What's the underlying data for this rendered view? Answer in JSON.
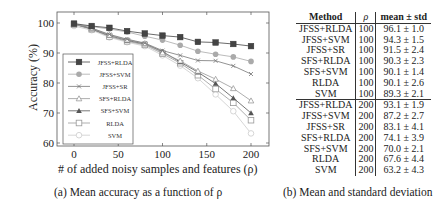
{
  "figure": {
    "caption_a": "(a) Mean accuracy as a function of ρ",
    "caption_b": "(b) Mean and standard deviation"
  },
  "chart_data": {
    "type": "line",
    "title": "",
    "xlabel": "# of added noisy samples and features (ρ)",
    "ylabel": "Accuracy (%)",
    "xlim": [
      -20,
      220
    ],
    "ylim": [
      60,
      103
    ],
    "xticks": [
      0,
      50,
      100,
      150,
      200
    ],
    "yticks": [
      60,
      70,
      80,
      90,
      100
    ],
    "grid": false,
    "legend_position": "lower left",
    "x": [
      0,
      20,
      40,
      60,
      80,
      100,
      120,
      140,
      160,
      180,
      200
    ],
    "series": [
      {
        "name": "JFSS+RLDA",
        "marker": "square-filled",
        "color": "#444444",
        "values": [
          99.8,
          99.0,
          98.4,
          97.3,
          96.5,
          95.8,
          95.3,
          93.7,
          93.5,
          93.0,
          92.3
        ]
      },
      {
        "name": "JFSS+SVM",
        "marker": "circle-filled",
        "color": "#aaaaaa",
        "values": [
          99.6,
          98.8,
          98.0,
          97.0,
          95.6,
          94.3,
          92.6,
          90.6,
          89.6,
          88.7,
          87.2
        ]
      },
      {
        "name": "JFSS+SR",
        "marker": "x",
        "color": "#777777",
        "values": [
          99.8,
          98.3,
          96.2,
          94.6,
          93.3,
          90.8,
          89.2,
          87.5,
          87.4,
          85.7,
          83.0
        ]
      },
      {
        "name": "SFS+RLDA",
        "marker": "triangle-open",
        "color": "#999999",
        "values": [
          99.6,
          98.2,
          96.0,
          94.4,
          93.2,
          90.1,
          87.4,
          84.0,
          81.3,
          78.2,
          74.1
        ]
      },
      {
        "name": "SFS+SVM",
        "marker": "triangle-filled",
        "color": "#555555",
        "values": [
          99.7,
          98.0,
          95.8,
          94.2,
          93.0,
          90.5,
          87.0,
          83.6,
          79.8,
          75.0,
          70.0
        ]
      },
      {
        "name": "RLDA",
        "marker": "square-open",
        "color": "#999999",
        "values": [
          99.5,
          97.9,
          95.5,
          93.9,
          92.7,
          89.8,
          86.6,
          82.6,
          78.0,
          73.4,
          67.6
        ]
      },
      {
        "name": "SVM",
        "marker": "circle-open",
        "color": "#cccccc",
        "values": [
          99.0,
          97.6,
          95.2,
          93.6,
          92.3,
          89.2,
          85.8,
          81.6,
          76.2,
          70.6,
          63.2
        ]
      }
    ]
  },
  "table": {
    "headers": [
      "Method",
      "ρ",
      "mean ± std"
    ],
    "rows": [
      [
        "JFSS+RLDA",
        "100",
        "96.1 ± 1.0"
      ],
      [
        "JFSS+SVM",
        "100",
        "94.3 ± 1.5"
      ],
      [
        "JFSS+SR",
        "100",
        "91.5 ± 2.4"
      ],
      [
        "SFS+RLDA",
        "100",
        "90.3 ± 2.3"
      ],
      [
        "SFS+SVM",
        "100",
        "90.1 ± 1.4"
      ],
      [
        "RLDA",
        "100",
        "90.1 ± 2.6"
      ],
      [
        "SVM",
        "100",
        "89.3 ± 2.1"
      ],
      [
        "JFSS+RLDA",
        "200",
        "93.1 ± 1.9"
      ],
      [
        "JFSS+SVM",
        "200",
        "87.2 ± 2.7"
      ],
      [
        "JFSS+SR",
        "200",
        "83.1 ± 4.1"
      ],
      [
        "SFS+RLDA",
        "200",
        "74.1 ± 3.9"
      ],
      [
        "SFS+SVM",
        "200",
        "70.0 ± 2.1"
      ],
      [
        "RLDA",
        "200",
        "67.6 ± 4.4"
      ],
      [
        "SVM",
        "200",
        "63.2 ± 4.3"
      ]
    ]
  }
}
